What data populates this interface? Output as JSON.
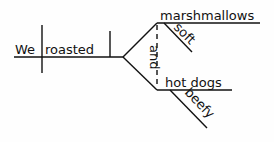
{
  "diagram": {
    "type": "sentence-diagram",
    "subject": "We",
    "verb": "roasted",
    "conjunction": "and",
    "objects": [
      {
        "word": "marshmallows",
        "modifier": "soft"
      },
      {
        "word": "hot dogs",
        "modifier": "beefy"
      }
    ]
  }
}
